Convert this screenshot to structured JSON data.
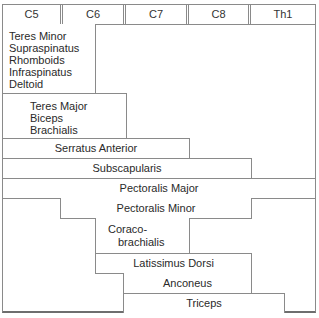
{
  "diagram": {
    "headers": [
      "C5",
      "C6",
      "C7",
      "C8",
      "Th1"
    ],
    "muscle_groups": [
      {
        "lines": [
          "Teres Minor",
          "Supraspinatus",
          "Rhomboids",
          "Infraspinatus",
          "Deltoid"
        ],
        "segments": "C5–C6"
      },
      {
        "lines": [
          "Teres Major",
          "Biceps",
          "Brachialis"
        ],
        "segments": "C5–C6"
      },
      {
        "lines": [
          "Serratus Anterior"
        ],
        "segments": "C5–C7"
      },
      {
        "lines": [
          "Subscapularis"
        ],
        "segments": "C5–C8"
      },
      {
        "lines": [
          "Pectoralis Major"
        ],
        "segments": "C5–Th1"
      },
      {
        "lines": [
          "Pectoralis Minor"
        ],
        "segments": "C6–C8"
      },
      {
        "lines": [
          "Coraco-",
          "brachialis"
        ],
        "segments": "C6–C7"
      },
      {
        "lines": [
          "Latissimus Dorsi"
        ],
        "segments": "C6–C8"
      },
      {
        "lines": [
          "Anconeus"
        ],
        "segments": "C7–C8"
      },
      {
        "lines": [
          "Triceps"
        ],
        "segments": "C7–Th1"
      }
    ]
  }
}
